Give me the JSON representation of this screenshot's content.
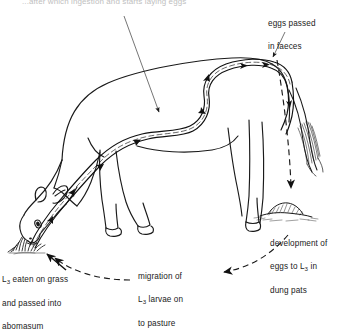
{
  "figure": {
    "background_color": "#ffffff",
    "ink_color": "#1a1a1a"
  },
  "labels": {
    "top_cut_off": "...after which ingestion and starts laying eggs",
    "eggs_faeces": {
      "line1": "eggs  passed",
      "line2": "in faeces",
      "full": "eggs passed in faeces"
    },
    "development": {
      "line1": "development of",
      "line2_a": "eggs  to  L",
      "line2_sub": "3",
      "line2_b": "  in",
      "line3": "dung pats",
      "full": "development of eggs to L3 in dung pats"
    },
    "migration": {
      "line1": "migration of",
      "line2_a": "L",
      "line2_sub": "3",
      "line2_b": " larvae on",
      "line3": "to pasture",
      "full": "migration of L3 larvae on to pasture"
    },
    "eaten": {
      "line1_a": "L",
      "line1_sub": "3",
      "line1_b": " eaten on grass",
      "line2": "and  passed  into",
      "line3": "abomasum",
      "full": "L3 eaten on grass and passed into abomasum"
    }
  },
  "elements": {
    "cow": "grazing-cow-outline",
    "digestive_tract": "digestive-tract-tube",
    "grass_tuft": "grass-tuft",
    "dung_pat": "dung-pat",
    "tail": "cow-tail",
    "leader_line_abomasum": "leader-line-to-abomasum",
    "leader_line_rectum": "leader-line-to-rectum",
    "arrow_eggs_down": "dashed-arrow-eggs-to-dung",
    "arrow_migration": "dashed-arrow-dung-to-pasture",
    "arrow_ingestion": "dashed-arrow-pasture-to-mouth",
    "arrow_into_grass": "solid-arrow-into-grass"
  }
}
